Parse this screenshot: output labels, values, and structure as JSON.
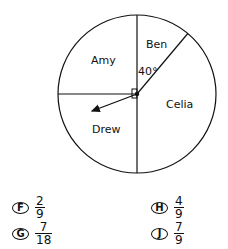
{
  "diagram": {
    "type": "circle-graph",
    "sectors": [
      {
        "label": "Amy"
      },
      {
        "label": "Ben",
        "angle_label": "40°"
      },
      {
        "label": "Celia"
      },
      {
        "label": "Drew"
      }
    ],
    "right_angle_marker": true,
    "arrow_spinner": true
  },
  "labels": {
    "amy": "Amy",
    "ben": "Ben",
    "celia": "Celia",
    "drew": "Drew",
    "angle": "40°"
  },
  "choices": [
    {
      "letter": "F",
      "numerator": "2",
      "denominator": "9"
    },
    {
      "letter": "G",
      "numerator": "7",
      "denominator": "18"
    },
    {
      "letter": "H",
      "numerator": "4",
      "denominator": "9"
    },
    {
      "letter": "J",
      "numerator": "7",
      "denominator": "9"
    }
  ]
}
